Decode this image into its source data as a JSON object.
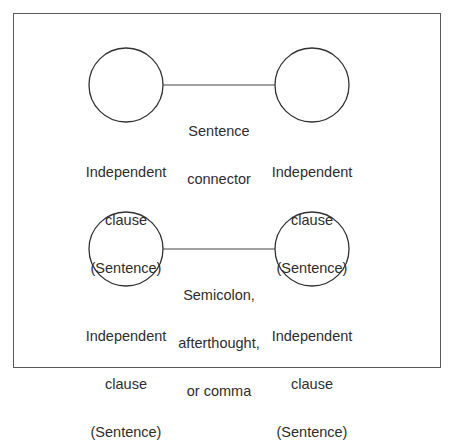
{
  "diagram": {
    "top_row": {
      "left_node": {
        "lines": [
          "Independent",
          "clause",
          "(Sentence)"
        ]
      },
      "connector": {
        "lines": [
          "Sentence",
          "connector"
        ]
      },
      "right_node": {
        "lines": [
          "Independent",
          "clause",
          "(Sentence)"
        ]
      }
    },
    "bottom_row": {
      "left_node": {
        "lines": [
          "Independent",
          "clause",
          "(Sentence)"
        ]
      },
      "connector": {
        "lines": [
          "Semicolon,",
          "afterthought,",
          "or comma"
        ]
      },
      "right_node": {
        "lines": [
          "Independent",
          "clause",
          "(Sentence)"
        ]
      }
    },
    "colors": {
      "stroke": "#333333",
      "frame": "#5a5a5a",
      "text": "#2e2e2e",
      "background": "#ffffff"
    }
  }
}
